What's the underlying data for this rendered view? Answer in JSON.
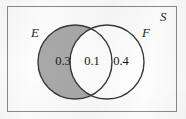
{
  "diagram": {
    "type": "venn",
    "universe": {
      "label": "S",
      "name": "sample-space"
    },
    "sets": [
      {
        "id": "E",
        "label": "E",
        "shaded": true,
        "fill_color": "#a9a9a9"
      },
      {
        "id": "F",
        "label": "F",
        "shaded": false,
        "fill_color": "#ffffff"
      }
    ],
    "regions": [
      {
        "id": "E-only",
        "label": "E only",
        "value": "0.3",
        "shaded": true
      },
      {
        "id": "E-and-F",
        "label": "E intersect F",
        "value": "0.1",
        "shaded": false
      },
      {
        "id": "F-only",
        "label": "F only",
        "value": "0.4",
        "shaded": false
      }
    ],
    "colors": {
      "shaded_fill": "#a9a9a9",
      "unshaded_fill": "#ffffff",
      "outline": "#3a3a3a",
      "rect_border": "#8b8b8b",
      "text": "#161616",
      "background": "#fdfdfd"
    }
  }
}
